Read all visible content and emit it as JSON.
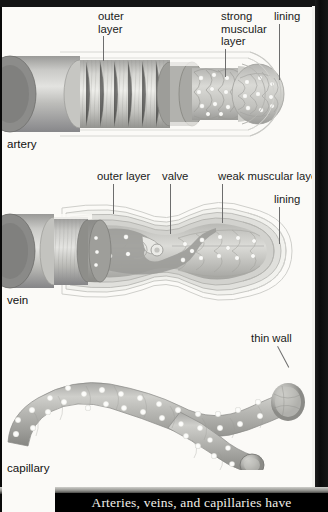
{
  "figure": {
    "caption": "Arteries, veins, and capillaries have",
    "background_color": "#fbfaf7",
    "frame_color": "#0b0b0b",
    "caption_text_color": "#f2f0ea"
  },
  "diagrams": [
    {
      "id": "artery",
      "name": "artery",
      "labels": [
        {
          "id": "artery-outer-layer",
          "text": "outer\nlayer"
        },
        {
          "id": "artery-muscular",
          "text": "strong\nmuscular\nlayer"
        },
        {
          "id": "artery-lining",
          "text": "lining"
        }
      ]
    },
    {
      "id": "vein",
      "name": "vein",
      "labels": [
        {
          "id": "vein-outer-layer",
          "text": "outer layer"
        },
        {
          "id": "vein-valve",
          "text": "valve"
        },
        {
          "id": "vein-weak-muscular",
          "text": "weak muscular layer"
        },
        {
          "id": "vein-lining",
          "text": "lining"
        }
      ]
    },
    {
      "id": "capillary",
      "name": "capillary",
      "labels": [
        {
          "id": "capillary-thin-wall",
          "text": "thin wall"
        }
      ]
    }
  ]
}
